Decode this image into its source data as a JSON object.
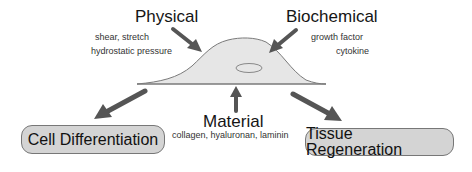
{
  "diagram": {
    "inputs": [
      {
        "id": "physical",
        "title": "Physical",
        "details": [
          "shear, stretch",
          "hydrostatic pressure"
        ]
      },
      {
        "id": "biochemical",
        "title": "Biochemical",
        "details": [
          "growth factor",
          "cytokine"
        ]
      },
      {
        "id": "material",
        "title": "Material",
        "details": [
          "collagen, hyaluronan, laminin"
        ]
      }
    ],
    "center": {
      "label": "cell",
      "description": "cell with nucleus"
    },
    "outcomes": [
      {
        "id": "cell-differentiation",
        "label": "Cell Differentiation"
      },
      {
        "id": "tissue-regeneration",
        "label": "Tissue Regeneration"
      }
    ],
    "colors": {
      "cell_fill": "#e6e6e6",
      "cell_outline": "#777777",
      "arrow": "#555555",
      "box_fill": "#d4d4d4",
      "box_border": "#777777"
    }
  }
}
